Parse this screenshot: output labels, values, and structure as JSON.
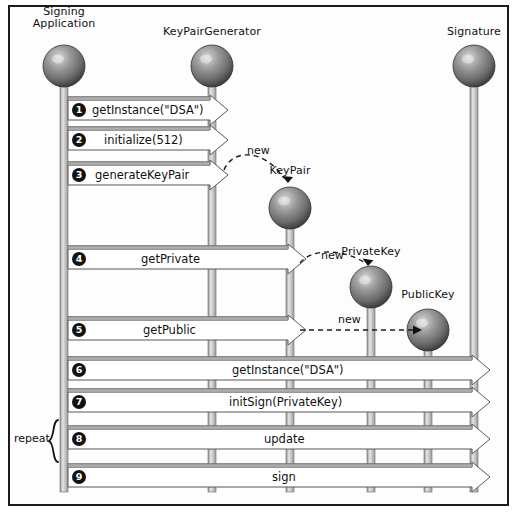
{
  "diagram": {
    "type": "uml-sequence-diagram",
    "border_color": "#1b1b1b",
    "background": "#fdfdfd",
    "sphere_color": "#6e6e6e",
    "lifeline_color": "#b9b9b9",
    "arrow_fill": "#ffffff",
    "arrow_stroke": "#4a4a4a",
    "badge_color": "#121212"
  },
  "participants": [
    {
      "id": "signing-application",
      "label_line1": "Signing",
      "label_line2": "Application",
      "x": 64,
      "sphere_y": 66,
      "label_y": 6
    },
    {
      "id": "keypairgenerator",
      "label_line1": "KeyPairGenerator",
      "label_line2": "",
      "x": 212,
      "sphere_y": 66,
      "label_y": 26
    },
    {
      "id": "keypair",
      "label_line1": "KeyPair",
      "label_line2": "",
      "x": 290,
      "sphere_y": 208,
      "label_y": 165
    },
    {
      "id": "privatekey",
      "label_line1": "PrivateKey",
      "label_line2": "",
      "x": 371,
      "sphere_y": 287,
      "label_y": 246
    },
    {
      "id": "publickey",
      "label_line1": "PublicKey",
      "label_line2": "",
      "x": 428,
      "sphere_y": 330,
      "label_y": 289
    },
    {
      "id": "signature",
      "label_line1": "Signature",
      "label_line2": "",
      "x": 474,
      "sphere_y": 66,
      "label_y": 26
    }
  ],
  "messages": [
    {
      "num": "1",
      "label": "getInstance(\"DSA\")",
      "from": "signing-application",
      "to": "keypairgenerator",
      "y": 110,
      "text_x": 92
    },
    {
      "num": "2",
      "label": "initialize(512)",
      "from": "signing-application",
      "to": "keypairgenerator",
      "y": 140,
      "text_x": 104
    },
    {
      "num": "3",
      "label": "generateKeyPair",
      "from": "signing-application",
      "to": "keypairgenerator",
      "y": 175,
      "text_x": 95
    },
    {
      "num": "4",
      "label": "getPrivate",
      "from": "signing-application",
      "to": "keypair",
      "y": 259,
      "text_x": 141
    },
    {
      "num": "5",
      "label": "getPublic",
      "from": "signing-application",
      "to": "keypair",
      "y": 330,
      "text_x": 143
    },
    {
      "num": "6",
      "label": "getInstance(\"DSA\")",
      "from": "signing-application",
      "to": "signature",
      "y": 370,
      "text_x": 232
    },
    {
      "num": "7",
      "label": "initSign(PrivateKey)",
      "from": "signing-application",
      "to": "signature",
      "y": 402,
      "text_x": 229
    },
    {
      "num": "8",
      "label": "update",
      "from": "signing-application",
      "to": "signature",
      "y": 439,
      "text_x": 264
    },
    {
      "num": "9",
      "label": "sign",
      "from": "signing-application",
      "to": "signature",
      "y": 477,
      "text_x": 272
    }
  ],
  "creation_arrows": [
    {
      "id": "new-keypair",
      "label": "new",
      "label_x": 247,
      "label_y": 144,
      "style": "curved"
    },
    {
      "id": "new-privatekey",
      "label": "new",
      "label_x": 321,
      "label_y": 249,
      "style": "curved"
    },
    {
      "id": "new-publickey",
      "label": "new",
      "label_x": 338,
      "label_y": 313,
      "style": "straight"
    }
  ],
  "annotations": {
    "repeat_label": "repeat",
    "repeat_x": 14,
    "repeat_y": 432,
    "repeat_bracket_top": 420,
    "repeat_bracket_bottom": 462
  }
}
